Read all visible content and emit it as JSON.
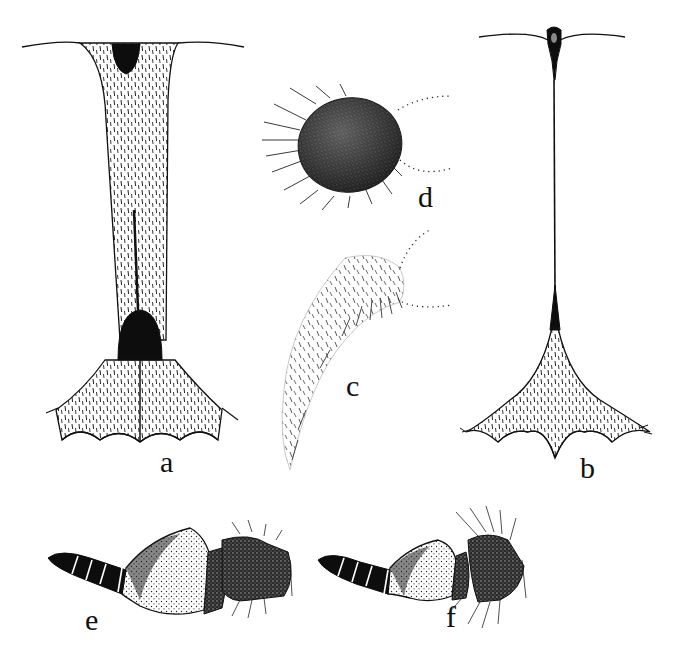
{
  "figure": {
    "background": "#ffffff",
    "ink_color": "#111111",
    "panels": [
      {
        "id": "a",
        "label": "a",
        "description": "broad tubular structure with dark basal bulb and scalloped flared base"
      },
      {
        "id": "b",
        "label": "b",
        "description": "thin stalk with dark knob at top and scalloped hairy flared base"
      },
      {
        "id": "c",
        "label": "c",
        "description": "pale curved lobe with sparse short setae"
      },
      {
        "id": "d",
        "label": "d",
        "description": "dark dense oval lobe with long setae"
      },
      {
        "id": "e",
        "label": "e",
        "description": "segmented appendage with stippled basal segment"
      },
      {
        "id": "f",
        "label": "f",
        "description": "segmented appendage with long setae on apical segment"
      }
    ]
  }
}
